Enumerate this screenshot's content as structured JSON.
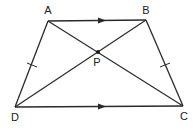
{
  "diagram": {
    "type": "geometry",
    "shape": "isosceles trapezium",
    "stroke_color": "#2a2a2a",
    "background": "#ffffff",
    "points": {
      "A": {
        "label": "A",
        "x": 48,
        "y": 21,
        "label_x": 48,
        "label_y": 14
      },
      "B": {
        "label": "B",
        "x": 146,
        "y": 20,
        "label_x": 146,
        "label_y": 13
      },
      "C": {
        "label": "C",
        "x": 183,
        "y": 106,
        "label_x": 184,
        "label_y": 120
      },
      "D": {
        "label": "D",
        "x": 15,
        "y": 107,
        "label_x": 15,
        "label_y": 121
      },
      "P": {
        "label": "P",
        "x": 98,
        "y": 52,
        "label_x": 97,
        "label_y": 66
      }
    },
    "segments": [
      {
        "from": "A",
        "to": "B",
        "marker": "parallel-arrow"
      },
      {
        "from": "D",
        "to": "C",
        "marker": "parallel-arrow"
      },
      {
        "from": "A",
        "to": "D",
        "marker": "equal-tick"
      },
      {
        "from": "B",
        "to": "C",
        "marker": "equal-tick"
      },
      {
        "from": "A",
        "to": "C",
        "marker": "none"
      },
      {
        "from": "B",
        "to": "D",
        "marker": "none"
      }
    ],
    "annotations": {
      "parallel": "AB ∥ DC",
      "equal": "AD = BC",
      "intersection": "P = AC ∩ BD"
    }
  }
}
